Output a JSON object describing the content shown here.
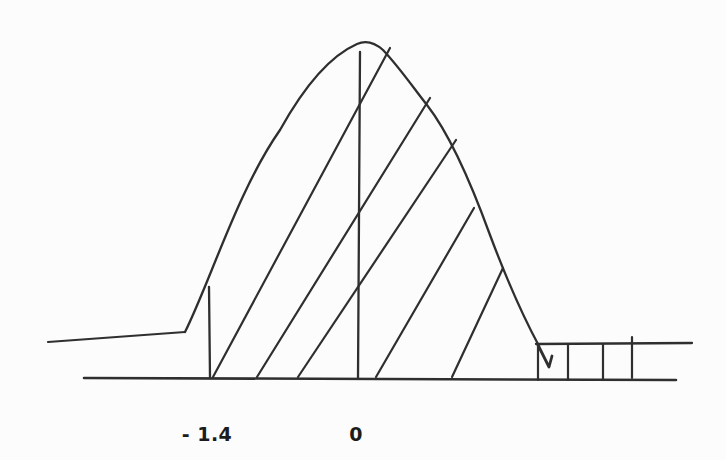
{
  "figure": {
    "background": "#fcfcfc",
    "ink": "#2f2f2f",
    "label_color": "#1c1c1c",
    "axis_labels": [
      {
        "id": "tick-minus-1-4",
        "text": "- 1.4",
        "x": 207,
        "y": 423
      },
      {
        "id": "tick-zero",
        "text": "0",
        "x": 356,
        "y": 423
      }
    ],
    "strokes": [
      {
        "name": "left-tail-line",
        "points": [
          [
            48,
            342
          ],
          [
            185,
            332
          ]
        ],
        "width": 2.2
      },
      {
        "name": "bell-curve",
        "path": "M 185 332 C 210 282 238 190 280 130 C 305 85 332 55 357 44 C 366 40 374 42 383 50 C 400 68 415 90 427 105 C 448 132 470 180 490 235 C 505 275 525 320 539 346",
        "width": 2.3
      },
      {
        "name": "curve-end-hook",
        "points": [
          [
            538,
            345
          ],
          [
            549,
            367
          ],
          [
            552,
            356
          ]
        ],
        "width": 2.8
      },
      {
        "name": "x-axis-baseline",
        "points": [
          [
            84,
            378
          ],
          [
            676,
            380
          ]
        ],
        "width": 2.6
      },
      {
        "name": "right-tail-top-line",
        "points": [
          [
            536,
            344
          ],
          [
            692,
            343
          ]
        ],
        "width": 2.3
      },
      {
        "name": "marker-line-minus-1-4",
        "points": [
          [
            209,
            287
          ],
          [
            210,
            378
          ]
        ],
        "width": 2.3
      },
      {
        "name": "marker-line-zero",
        "points": [
          [
            360,
            52
          ],
          [
            358,
            378
          ]
        ],
        "width": 2.3
      },
      {
        "name": "hatch-diagonal-1",
        "points": [
          [
            213,
            377
          ],
          [
            390,
            48
          ]
        ],
        "width": 2.2
      },
      {
        "name": "hatch-diagonal-2",
        "points": [
          [
            257,
            377
          ],
          [
            430,
            98
          ]
        ],
        "width": 2.2
      },
      {
        "name": "hatch-diagonal-3",
        "points": [
          [
            298,
            377
          ],
          [
            456,
            140
          ]
        ],
        "width": 2.2
      },
      {
        "name": "hatch-diagonal-4",
        "points": [
          [
            376,
            377
          ],
          [
            474,
            208
          ]
        ],
        "width": 2.2
      },
      {
        "name": "hatch-diagonal-5",
        "points": [
          [
            452,
            377
          ],
          [
            503,
            268
          ]
        ],
        "width": 2.2
      },
      {
        "name": "tail-hatch-vertical-1",
        "points": [
          [
            538,
            345
          ],
          [
            538,
            380
          ]
        ],
        "width": 2.2
      },
      {
        "name": "tail-hatch-vertical-2",
        "points": [
          [
            568,
            344
          ],
          [
            568,
            380
          ]
        ],
        "width": 2.2
      },
      {
        "name": "tail-hatch-vertical-3",
        "points": [
          [
            603,
            344
          ],
          [
            603,
            380
          ]
        ],
        "width": 2.2
      },
      {
        "name": "tail-hatch-vertical-4",
        "points": [
          [
            632,
            337
          ],
          [
            632,
            378
          ]
        ],
        "width": 2.2
      }
    ]
  },
  "chart_data": {
    "type": "area",
    "title": "",
    "curve": "normal distribution bell curve, hand drawn",
    "x_tick_labels": [
      "- 1.4",
      "0"
    ],
    "shaded_region": "area under the curve from -1.4 rightward shown with diagonal hatch lines; right tail strip beyond the curve hatched with vertical lines",
    "grid": false,
    "legend": false
  }
}
